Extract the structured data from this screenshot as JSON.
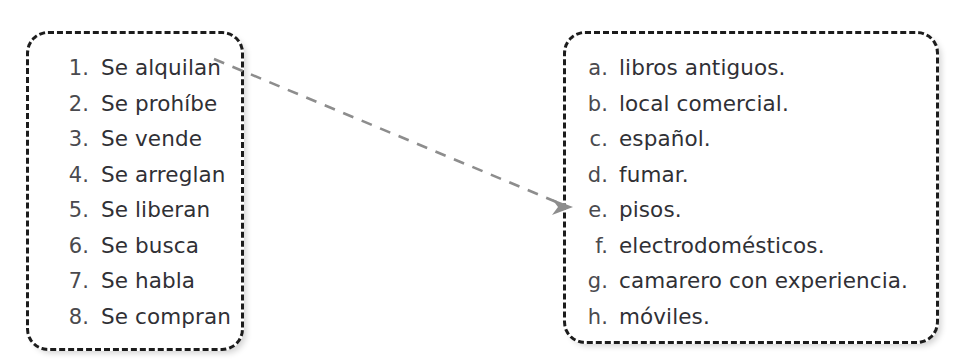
{
  "exercise": {
    "left_column": {
      "name": "numbered-phrases",
      "items": [
        {
          "marker": "1.",
          "label": "Se alquilan"
        },
        {
          "marker": "2.",
          "label": "Se prohíbe"
        },
        {
          "marker": "3.",
          "label": "Se vende"
        },
        {
          "marker": "4.",
          "label": "Se arreglan"
        },
        {
          "marker": "5.",
          "label": "Se liberan"
        },
        {
          "marker": "6.",
          "label": "Se busca"
        },
        {
          "marker": "7.",
          "label": "Se habla"
        },
        {
          "marker": "8.",
          "label": "Se compran"
        }
      ]
    },
    "right_column": {
      "name": "lettered-completions",
      "items": [
        {
          "marker": "a.",
          "label": "libros antiguos."
        },
        {
          "marker": "b.",
          "label": "local comercial."
        },
        {
          "marker": "c.",
          "label": "español."
        },
        {
          "marker": "d.",
          "label": "fumar."
        },
        {
          "marker": "e.",
          "label": "pisos."
        },
        {
          "marker": "f.",
          "label": "electrodomésticos."
        },
        {
          "marker": "g.",
          "label": "camarero con experiencia."
        },
        {
          "marker": "h.",
          "label": "móviles."
        }
      ]
    },
    "connections": [
      {
        "from": "1.",
        "to": "e.",
        "style": "dashed-arrow"
      }
    ]
  },
  "colors": {
    "text": "#36363a",
    "border": "#1c1c1c",
    "arrow": "#8a8a8a",
    "background": "#ffffff"
  }
}
